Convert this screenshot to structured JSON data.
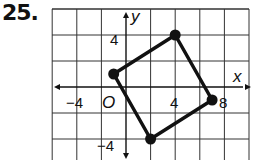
{
  "problem_number": "25.",
  "graph": {
    "x_axis_label": "x",
    "y_axis_label": "y",
    "origin_label": "O",
    "grid_unit": 2,
    "x_tick_labels": [
      "−4",
      "4",
      "8"
    ],
    "y_tick_labels": [
      "4",
      "−4"
    ],
    "x_range": [
      -6,
      10
    ],
    "y_range": [
      -6,
      6
    ],
    "quadrilateral_vertices": [
      {
        "x": -1,
        "y": 1
      },
      {
        "x": 4,
        "y": 4
      },
      {
        "x": 7,
        "y": -1
      },
      {
        "x": 2,
        "y": -4
      }
    ],
    "line_color": "#111111",
    "grid_color": "#333333"
  }
}
